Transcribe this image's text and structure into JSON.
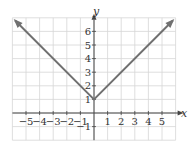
{
  "chart_data": {
    "type": "line",
    "title": "",
    "function": "y = |x| + 1",
    "xlabel": "x",
    "ylabel": "y",
    "xlim": [
      -6,
      6
    ],
    "ylim": [
      -2,
      7
    ],
    "grid": true,
    "x_ticks": [
      -5,
      -4,
      -3,
      -2,
      -1,
      1,
      2,
      3,
      4,
      5
    ],
    "y_ticks": [
      -1,
      1,
      2,
      3,
      4,
      5,
      6
    ],
    "x_tick_labels": [
      "−5",
      "−4",
      "−3",
      "−2",
      "−1",
      "1",
      "2",
      "3",
      "4",
      "5"
    ],
    "y_tick_labels": [
      "−1",
      "1",
      "2",
      "3",
      "4",
      "5",
      "6"
    ],
    "series": [
      {
        "name": "y = |x| + 1",
        "x": [
          -5.8,
          0,
          5.8
        ],
        "y": [
          6.8,
          1,
          6.8
        ],
        "arrows_both_ends": true,
        "color": "#707070"
      }
    ],
    "colors": {
      "grid": "#d6d6d6",
      "axis": "#444444",
      "curve": "#707070"
    }
  }
}
